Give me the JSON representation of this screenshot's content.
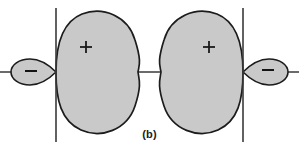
{
  "figure": {
    "caption": "(b)",
    "type": "orbital-lobe-diagram",
    "colors": {
      "lobe_fill": "#c9c9c9",
      "lobe_stroke": "#1c1c1c",
      "axis_stroke": "#3a3a3a",
      "background": "#ffffff",
      "label_color": "#1a1a1a"
    },
    "axes": {
      "horizontal_y": 72,
      "horizontal_x_start": 0,
      "horizontal_x_end": 299,
      "vertical_left_x": 56,
      "vertical_right_x": 243,
      "vertical_y_start": 8,
      "vertical_y_end": 142
    },
    "orbitals": [
      {
        "name": "left-orbital",
        "major_lobe_sign": "+",
        "minor_lobe_sign": "−",
        "major_sign_x": 86,
        "major_sign_y": 47,
        "minor_sign_x": 31,
        "minor_sign_y": 72,
        "node_x": 56,
        "major_extent_x": 138,
        "minor_extent_x": 11
      },
      {
        "name": "right-orbital",
        "major_lobe_sign": "+",
        "minor_lobe_sign": "−",
        "major_sign_x": 209,
        "major_sign_y": 47,
        "minor_sign_x": 268,
        "minor_sign_y": 71,
        "node_x": 243,
        "major_extent_x": 163,
        "minor_extent_x": 288
      }
    ]
  }
}
